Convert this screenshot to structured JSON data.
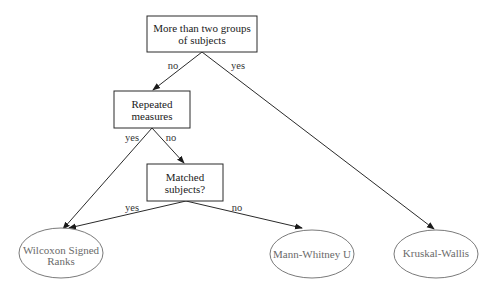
{
  "diagram": {
    "type": "decision-tree",
    "nodes": {
      "groups": {
        "line1": "More than two groups",
        "line2": "of subjects"
      },
      "repeated": {
        "line1": "Repeated",
        "line2": "measures"
      },
      "matched": {
        "line1": "Matched",
        "line2": "subjects?"
      },
      "wilcoxon": {
        "line1": "Wilcoxon Signed",
        "line2": "Ranks"
      },
      "mann": {
        "line1": "Mann-Whitney U"
      },
      "kruskal": {
        "line1": "Kruskal-Wallis"
      }
    },
    "edges": {
      "groups_no": "no",
      "groups_yes": "yes",
      "repeated_yes": "yes",
      "repeated_no": "no",
      "matched_yes": "yes",
      "matched_no": "no"
    },
    "colors": {
      "line": "#2a2a2a",
      "box_text": "#1a1a1a",
      "leaf_text": "#6a6a6a",
      "leaf_border": "#7a7a7a"
    }
  }
}
